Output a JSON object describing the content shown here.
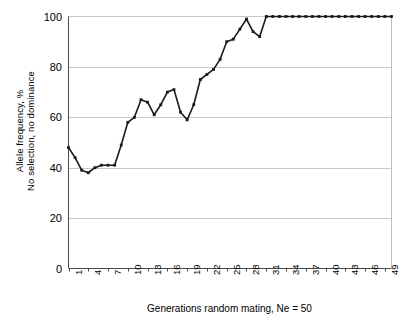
{
  "chart_data": {
    "type": "line",
    "title": "",
    "xlabel": "Generations random mating, Ne = 50",
    "ylabel": "Allele frequency, %\nNo selection, no dominance",
    "ylabel_line1": "Allele frequency, %",
    "ylabel_line2": "No selection, no dominance",
    "ylim": [
      0,
      100
    ],
    "xlim": [
      1,
      50
    ],
    "grid": "horizontal",
    "legend": "none",
    "marker": "square",
    "line_color": "#1a1a1a",
    "grid_color": "#c8c8c8",
    "y_ticks": [
      0,
      20,
      40,
      60,
      80,
      100
    ],
    "y_tick_labels": [
      "0",
      "20",
      "40",
      "60",
      "80",
      "100"
    ],
    "x_ticks": [
      1,
      4,
      7,
      10,
      13,
      16,
      19,
      22,
      25,
      28,
      31,
      34,
      37,
      40,
      43,
      46,
      49
    ],
    "x_tick_labels": [
      "1",
      "4",
      "7",
      "10",
      "13",
      "16",
      "19",
      "22",
      "25",
      "28",
      "31",
      "34",
      "37",
      "40",
      "43",
      "46",
      "49"
    ],
    "x": [
      1,
      2,
      3,
      4,
      5,
      6,
      7,
      8,
      9,
      10,
      11,
      12,
      13,
      14,
      15,
      16,
      17,
      18,
      19,
      20,
      21,
      22,
      23,
      24,
      25,
      26,
      27,
      28,
      29,
      30,
      31,
      32,
      33,
      34,
      35,
      36,
      37,
      38,
      39,
      40,
      41,
      42,
      43,
      44,
      45,
      46,
      47,
      48,
      49,
      50
    ],
    "values": [
      48,
      44,
      39,
      38,
      40,
      41,
      41,
      41,
      49,
      58,
      60,
      67,
      66,
      61,
      65,
      70,
      71,
      62,
      59,
      65,
      75,
      77,
      79,
      83,
      90,
      91,
      95,
      99,
      94,
      92,
      100,
      100,
      100,
      100,
      100,
      100,
      100,
      100,
      100,
      100,
      100,
      100,
      100,
      100,
      100,
      100,
      100,
      100,
      100,
      100
    ],
    "series_name": "Allele frequency"
  },
  "axis": {
    "y_title_line1": "Allele frequency, %",
    "y_title_line2": "No selection, no dominance",
    "x_title": "Generations random mating, Ne = 50"
  },
  "clipped_header": ""
}
